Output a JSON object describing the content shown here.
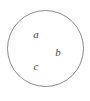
{
  "figure": {
    "type": "venn-single-set-diagram",
    "background_color": "#ffffff",
    "circle": {
      "name": "set-circle",
      "stroke_color": "#8c8c8c",
      "fill_color": "#ffffff",
      "stroke_width": 1,
      "center_x": 45.5,
      "center_y": 48.5,
      "radius": 38
    },
    "labels": [
      {
        "text": "a",
        "x": 36,
        "y": 34,
        "color": "#4a4a4a",
        "style": "italic"
      },
      {
        "text": "b",
        "x": 58,
        "y": 52,
        "color": "#4a4a4a",
        "style": "italic"
      },
      {
        "text": "c",
        "x": 36,
        "y": 66,
        "color": "#4a4a4a",
        "style": "italic"
      }
    ]
  }
}
